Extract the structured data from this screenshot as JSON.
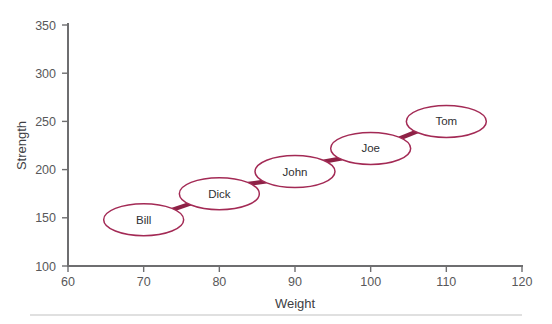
{
  "chart_data": {
    "type": "scatter",
    "title": "",
    "xlabel": "Weight",
    "ylabel": "Strength",
    "xlim": [
      60,
      120
    ],
    "ylim": [
      100,
      350
    ],
    "xticks": [
      60,
      70,
      80,
      90,
      100,
      110,
      120
    ],
    "yticks": [
      100,
      150,
      200,
      250,
      300,
      350
    ],
    "xtick_labels": [
      "60",
      "70",
      "80",
      "90",
      "100",
      "110",
      "120"
    ],
    "ytick_labels": [
      "100",
      "150",
      "200",
      "250",
      "300",
      "350"
    ],
    "grid": false,
    "legend": "none",
    "marker_shape": "ellipse-with-label",
    "connected": true,
    "points": [
      {
        "label": "Bill",
        "x": 70,
        "y": 148
      },
      {
        "label": "Dick",
        "x": 80,
        "y": 175
      },
      {
        "label": "John",
        "x": 90,
        "y": 198
      },
      {
        "label": "Joe",
        "x": 100,
        "y": 222
      },
      {
        "label": "Tom",
        "x": 110,
        "y": 250
      }
    ],
    "colors": {
      "marker_stroke": "#a32a55",
      "connector": "#8e2246",
      "axis": "#6e6e70",
      "tick_text": "#58585a",
      "axis_title": "#404043",
      "marker_fill": "#ffffff",
      "background": "#ffffff",
      "footer_rule": "#d6d6d6"
    }
  }
}
